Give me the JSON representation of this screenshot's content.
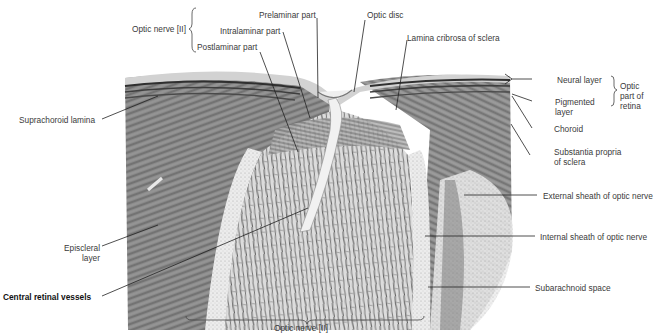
{
  "figure": {
    "colors": {
      "background": "#ffffff",
      "label_text": "#3a3a3a",
      "leader_line": "#222222",
      "sclera_dark": "#6e6e6e",
      "nerve_light": "#d9d9d9"
    }
  },
  "labels": {
    "optic_nerve_top": "Optic nerve [II]",
    "prelaminar_part": "Prelaminar part",
    "intralaminar_part": "Intralaminar part",
    "postlaminar_part": "Postlaminar part",
    "optic_disc": "Optic disc",
    "lamina_cribrosa": "Lamina cribrosa of sclera",
    "neural_layer": "Neural layer",
    "optic_part_of_retina_1": "Optic",
    "optic_part_of_retina_2": "part of",
    "optic_part_of_retina_3": "retina",
    "pigmented_layer_1": "Pigmented",
    "pigmented_layer_2": "layer",
    "choroid": "Choroid",
    "substantia_propria_1": "Substantia propria",
    "substantia_propria_2": "of sclera",
    "suprachoroid_lamina": "Suprachoroid lamina",
    "external_sheath": "External sheath of optic nerve",
    "internal_sheath": "Internal sheath of optic nerve",
    "episcleral_layer_1": "Episcleral",
    "episcleral_layer_2": "layer",
    "central_retinal_vessels": "Central retinal vessels",
    "subarachnoid_space": "Subarachnoid space",
    "optic_nerve_bottom": "Optic nerve [II]"
  }
}
